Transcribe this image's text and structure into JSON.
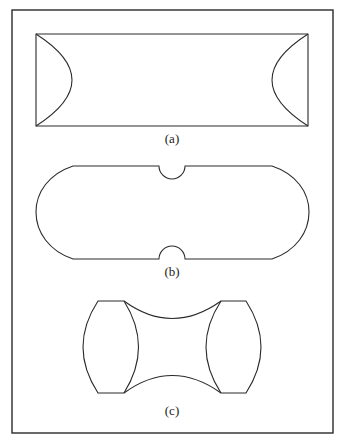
{
  "figure": {
    "panels": [
      {
        "id": "a",
        "label": "(a)",
        "description": "Rectangle with two inward-facing curved arcs at left and right ends"
      },
      {
        "id": "b",
        "label": "(b)",
        "description": "Rounded stadium shape with semicircular notches at top and bottom center"
      },
      {
        "id": "c",
        "label": "(c)",
        "description": "Two lens-shaped ends joined by concave top and bottom curves"
      }
    ]
  },
  "colors": {
    "stroke": "#2a2a2a",
    "background": "#ffffff"
  }
}
